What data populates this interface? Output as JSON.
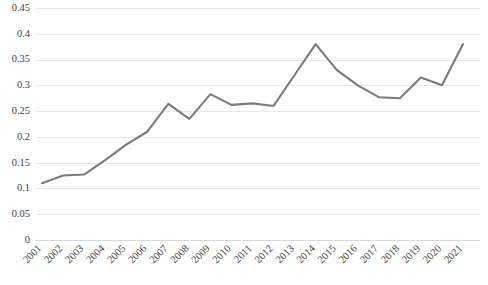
{
  "chart_data": {
    "type": "line",
    "title": "",
    "subtitle": "",
    "xlabel": "",
    "ylabel": "",
    "categories": [
      "2001",
      "2002",
      "2003",
      "2004",
      "2005",
      "2006",
      "2007",
      "2008",
      "2009",
      "2010",
      "2011",
      "2012",
      "2013",
      "2014",
      "2015",
      "2016",
      "2017",
      "2018",
      "2019",
      "2020",
      "2021"
    ],
    "values": [
      0.11,
      0.125,
      0.127,
      0.155,
      0.185,
      0.21,
      0.264,
      0.235,
      0.283,
      0.262,
      0.265,
      0.26,
      0.32,
      0.38,
      0.33,
      0.3,
      0.277,
      0.275,
      0.315,
      0.3,
      0.38
    ],
    "series": [
      {
        "name": "",
        "color": "#7b7b7b",
        "values": [
          0.11,
          0.125,
          0.127,
          0.155,
          0.185,
          0.21,
          0.264,
          0.235,
          0.283,
          0.262,
          0.265,
          0.26,
          0.32,
          0.38,
          0.33,
          0.3,
          0.277,
          0.275,
          0.315,
          0.3,
          0.38
        ]
      }
    ],
    "ylim": [
      0,
      0.45
    ],
    "yticks": [
      0,
      0.05,
      0.1,
      0.15,
      0.2,
      0.25,
      0.3,
      0.35,
      0.4,
      0.45
    ],
    "ytick_labels": [
      "0",
      "0.05",
      "0.1",
      "0.15",
      "0.2",
      "0.25",
      "0.3",
      "0.35",
      "0.4",
      "0.45"
    ],
    "grid": true,
    "grid_axis": "y",
    "legend": false,
    "legend_position": "none",
    "markers": false,
    "annotations": [],
    "colors": {
      "line": "#7b7b7b",
      "gridline": "#e8e8e8",
      "baseline": "#d9d9d9",
      "tick_text": "#404040",
      "background": "#ffffff"
    },
    "xtick_rotation": 45
  }
}
